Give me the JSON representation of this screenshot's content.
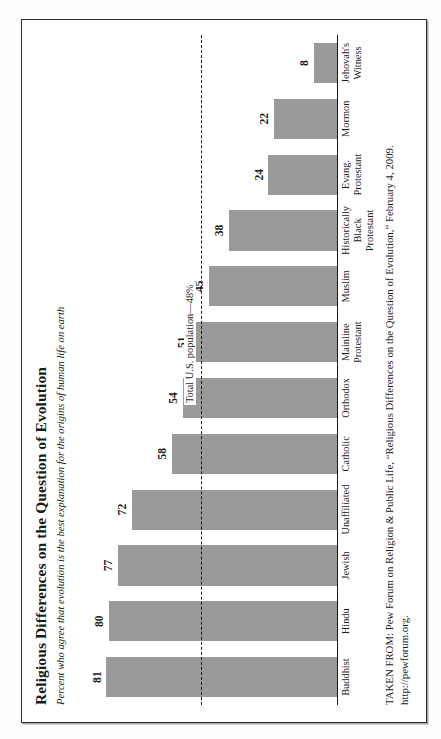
{
  "figure": {
    "title": "Religious Differences on the Question of Evolution",
    "subtitle": "Percent who agree that evolution is the best explanation for the origins of human life on earth",
    "source_line_1": "TAKEN FROM: Pew Forum on Religion & Public Life, “Religious Differences on the Question of Evolution,” February 4, 2009.",
    "source_line_2": "http://pewforum.org.",
    "bar_color": "#9a9a9a",
    "axis_color": "#1a1a1a",
    "frame_color": "#2b2b2b"
  },
  "chart_data": {
    "type": "bar",
    "title": "Religious Differences on the Question of Evolution",
    "subtitle": "Percent who agree that evolution is the best explanation for the origins of human life on earth",
    "xlabel": "",
    "ylabel": "",
    "ylim": [
      0,
      90
    ],
    "grid": false,
    "legend": false,
    "orientation": "vertical",
    "categories": [
      "Buddhist",
      "Hindu",
      "Jewish",
      "Unaffiliated",
      "Catholic",
      "Orthodox",
      "Mainline Protestant",
      "Muslim",
      "Historically Black Protestant",
      "Evang. Protestant",
      "Mormon",
      "Jehovah's Witness"
    ],
    "values": [
      81,
      80,
      77,
      72,
      58,
      54,
      51,
      45,
      38,
      24,
      22,
      8
    ],
    "value_labels": [
      "81",
      "80",
      "77",
      "72",
      "58",
      "54",
      "51",
      "45",
      "38",
      "24",
      "22",
      "8"
    ],
    "annotations": [
      {
        "type": "reference-line",
        "label": "Total U.S. population—48%",
        "value": 48,
        "style": "dashed"
      }
    ]
  }
}
